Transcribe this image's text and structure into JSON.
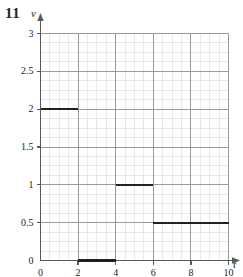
{
  "figure": {
    "problem_number": "11",
    "background_color": "#ffffff"
  },
  "chart_data": {
    "type": "line",
    "title": "",
    "subtitle": "",
    "xlabel": "t",
    "ylabel": "v",
    "xlim": [
      0,
      10
    ],
    "ylim": [
      0,
      3
    ],
    "grid": true,
    "grid_major_color": "#9a9a9a",
    "grid_minor_color": "#e8e8e8",
    "axis_color": "#58595b",
    "series_color": "#231f20",
    "legend": [],
    "legend_position": "none",
    "x_ticks": [
      0,
      2,
      4,
      6,
      8,
      10
    ],
    "x_tick_labels": [
      "0",
      "2",
      "4",
      "6",
      "8",
      "10"
    ],
    "y_ticks": [
      0,
      0.5,
      1,
      1.5,
      2,
      2.5,
      3
    ],
    "y_tick_labels": [
      "0",
      "0.5",
      "1",
      "1.5",
      "2",
      "2.5",
      "3"
    ],
    "x_minor_step": 0.5,
    "y_minor_step": 0.125,
    "style": "step-function",
    "steps": [
      {
        "x_start": 0,
        "x_end": 2,
        "value": 2
      },
      {
        "x_start": 2,
        "x_end": 4,
        "value": 0
      },
      {
        "x_start": 4,
        "x_end": 6,
        "value": 1
      },
      {
        "x_start": 6,
        "x_end": 10,
        "value": 0.5
      }
    ],
    "annotations": []
  }
}
